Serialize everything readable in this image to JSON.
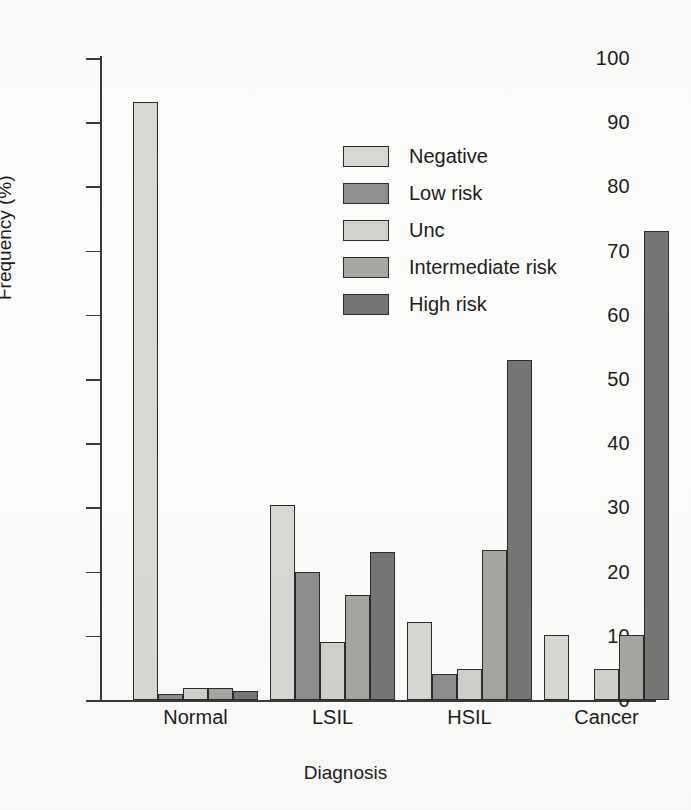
{
  "chart_data": {
    "type": "bar",
    "title": "",
    "xlabel": "Diagnosis",
    "ylabel": "Frequency (%)",
    "categories": [
      "Normal",
      "LSIL",
      "HSIL",
      "Cancer"
    ],
    "ylim": [
      0,
      100
    ],
    "yticks": [
      0,
      10,
      20,
      30,
      40,
      50,
      60,
      70,
      80,
      90,
      100
    ],
    "grid": false,
    "legend_position": "upper-left-inside",
    "series": [
      {
        "name": "Negative",
        "color": "#d8d8d4",
        "values": [
          93.2,
          30.3,
          12.2,
          10.2
        ]
      },
      {
        "name": "Low risk",
        "color": "#8e8e8e",
        "values": [
          0.9,
          19.9,
          4.1,
          0
        ]
      },
      {
        "name": "Unc",
        "color": "#d0d0cc",
        "values": [
          1.9,
          9.0,
          4.9,
          4.8
        ]
      },
      {
        "name": "Intermediate risk",
        "color": "#a6a6a2",
        "values": [
          1.9,
          16.3,
          23.3,
          10.1
        ]
      },
      {
        "name": "High risk",
        "color": "#767674",
        "values": [
          1.4,
          23.1,
          52.9,
          73.0
        ]
      }
    ]
  },
  "figure": {
    "axis_color": "#3a3a3a",
    "bar_outline": "#2b2b2b",
    "background": "#fcfcfa"
  }
}
